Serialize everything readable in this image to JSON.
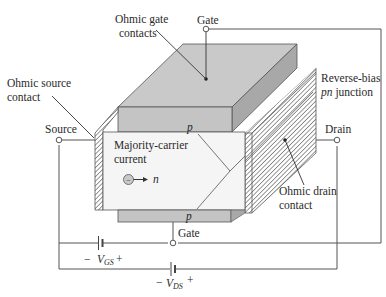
{
  "diagram": {
    "labels": {
      "ohmic_gate_contacts_1": "Ohmic gate",
      "ohmic_gate_contacts_2": "contacts",
      "gate_top": "Gate",
      "ohmic_source_contact_1": "Ohmic source",
      "ohmic_source_contact_2": "contact",
      "reverse_bias_1": "Reverse-bias",
      "reverse_bias_2_italic": "pn",
      "reverse_bias_2_rest": " junction",
      "source": "Source",
      "drain": "Drain",
      "p_top": "p",
      "p_bottom": "p",
      "majority_carrier_1": "Majority-carrier",
      "majority_carrier_2": "current",
      "carrier_n": "n",
      "carrier_sign": "−",
      "ohmic_drain_contact_1": "Ohmic drain",
      "ohmic_drain_contact_2": "contact",
      "gate_bottom": "Gate",
      "vgs_minus": "−",
      "vgs_v": "V",
      "vgs_sub": "GS",
      "vgs_plus": "+",
      "vds_minus": "−",
      "vds_v": "V",
      "vds_sub": "DS",
      "vds_plus": "+"
    },
    "colors": {
      "gate_top_face": "#c9c9c9",
      "gate_front_face": "#c4c4c4",
      "gate_side_face": "#a9a9a9",
      "channel": "#f4f4f4",
      "hatch": "#7a7a7a",
      "wire": "#555555",
      "text": "#2a2a2a"
    }
  }
}
